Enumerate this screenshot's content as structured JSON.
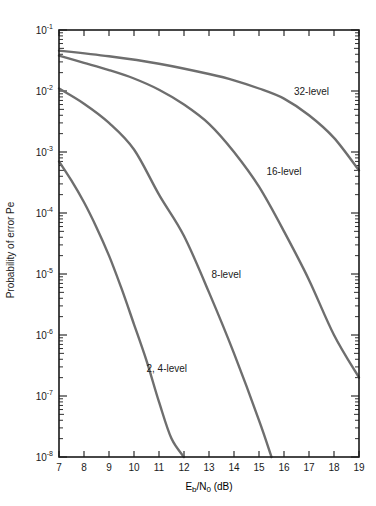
{
  "chart_data": {
    "type": "line",
    "title": "",
    "xlabel": "E_b/N_0 (dB)",
    "xlabel_main": "E",
    "xlabel_sub1": "b",
    "xlabel_mid": "/N",
    "xlabel_sub2": "0",
    "xlabel_tail": " (dB)",
    "ylabel": "Probability of error Pe",
    "xlim": [
      7,
      19
    ],
    "ylim": [
      1e-08,
      0.1
    ],
    "yscale": "log",
    "grid": false,
    "x_ticks": [
      7,
      8,
      9,
      10,
      11,
      12,
      13,
      14,
      15,
      16,
      17,
      18,
      19
    ],
    "y_ticks": [
      {
        "exp": -1,
        "label": "10",
        "sup": "-1"
      },
      {
        "exp": -2,
        "label": "10",
        "sup": "-2"
      },
      {
        "exp": -3,
        "label": "10",
        "sup": "-3"
      },
      {
        "exp": -4,
        "label": "10",
        "sup": "-4"
      },
      {
        "exp": -5,
        "label": "10",
        "sup": "-5"
      },
      {
        "exp": -6,
        "label": "10",
        "sup": "-6"
      },
      {
        "exp": -7,
        "label": "10",
        "sup": "-7"
      },
      {
        "exp": -8,
        "label": "10",
        "sup": "-8"
      }
    ],
    "series": [
      {
        "name": "32-level",
        "label_pos": [
          16.4,
          0.0085
        ],
        "points": [
          [
            7,
            0.046
          ],
          [
            9,
            0.037
          ],
          [
            11,
            0.028
          ],
          [
            13,
            0.019
          ],
          [
            14,
            0.015
          ],
          [
            15,
            0.011
          ],
          [
            16,
            0.0075
          ],
          [
            17,
            0.004
          ],
          [
            18,
            0.0017
          ],
          [
            19,
            0.0005
          ]
        ]
      },
      {
        "name": "16-level",
        "label_pos": [
          15.3,
          0.00042
        ],
        "points": [
          [
            7,
            0.038
          ],
          [
            8,
            0.029
          ],
          [
            9,
            0.022
          ],
          [
            10,
            0.016
          ],
          [
            11,
            0.0105
          ],
          [
            12,
            0.006
          ],
          [
            13,
            0.0029
          ],
          [
            14,
            0.001
          ],
          [
            15,
            0.00027
          ],
          [
            16,
            5e-05
          ],
          [
            17,
            8e-06
          ],
          [
            18,
            1e-06
          ],
          [
            19,
            2e-07
          ]
        ]
      },
      {
        "name": "8-level",
        "label_pos": [
          13.1,
          8.5e-06
        ],
        "points": [
          [
            7,
            0.011
          ],
          [
            8,
            0.0062
          ],
          [
            9,
            0.003
          ],
          [
            10,
            0.0011
          ],
          [
            11,
            0.0002
          ],
          [
            12,
            4.2e-05
          ],
          [
            13,
            5e-06
          ],
          [
            14,
            5e-07
          ],
          [
            15,
            4e-08
          ],
          [
            15.5,
            1e-08
          ]
        ]
      },
      {
        "name": "2, 4-level",
        "label_pos": [
          10.5,
          2.5e-07
        ],
        "points": [
          [
            7,
            0.0007
          ],
          [
            7.5,
            0.00034
          ],
          [
            8,
            0.00015
          ],
          [
            8.5,
            5.8e-05
          ],
          [
            9,
            2e-05
          ],
          [
            9.5,
            5.8e-06
          ],
          [
            10,
            1.5e-06
          ],
          [
            10.5,
            3.8e-07
          ],
          [
            11,
            8e-08
          ],
          [
            11.5,
            2e-08
          ],
          [
            12,
            1e-08
          ]
        ]
      }
    ]
  },
  "colors": {
    "axis": "#1a1a1a",
    "curve": "#6e6e6e",
    "background": "#ffffff"
  }
}
